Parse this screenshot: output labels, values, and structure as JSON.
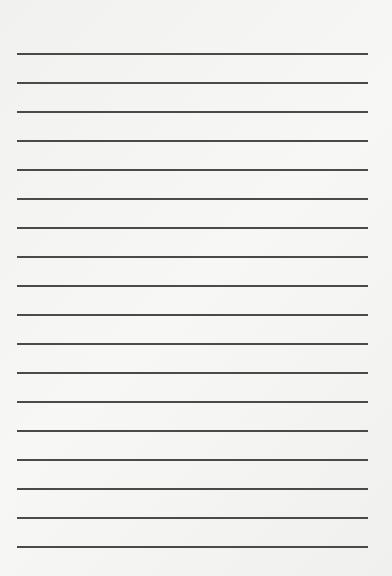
{
  "page": {
    "type": "lined-paper",
    "line_count": 18,
    "line_color": "#4a4a4a",
    "background": "#f3f3f1",
    "line_positions_y": [
      53,
      82,
      111,
      140,
      169,
      198,
      227,
      256,
      285,
      314,
      343,
      372,
      401,
      430,
      459,
      488,
      517,
      546
    ]
  }
}
